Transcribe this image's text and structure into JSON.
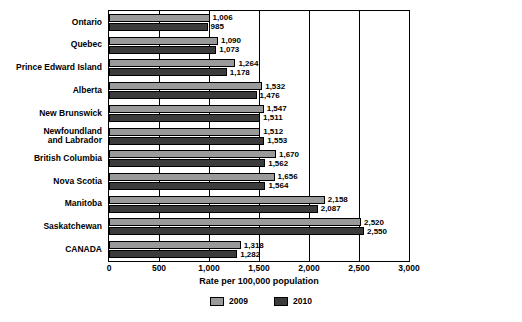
{
  "chart_data": {
    "type": "bar",
    "orientation": "horizontal",
    "title": "",
    "xlabel": "Rate per 100,000 population",
    "ylabel": "",
    "xlim": [
      0,
      3000
    ],
    "xticks": [
      "0",
      "500",
      "1,000",
      "1,500",
      "2,000",
      "2,500",
      "3,000"
    ],
    "grid": true,
    "legend_position": "bottom",
    "categories": [
      "Ontario",
      "Quebec",
      "Prince Edward Island",
      "Alberta",
      "New Brunswick",
      "Newfoundland\nand Labrador",
      "British Columbia",
      "Nova Scotia",
      "Manitoba",
      "Saskatchewan",
      "CANADA"
    ],
    "series": [
      {
        "name": "2009",
        "color": "#9a9a9a",
        "values": [
          1006,
          1090,
          1264,
          1532,
          1547,
          1512,
          1670,
          1656,
          2158,
          2520,
          1318
        ],
        "labels": [
          "1,006",
          "1,090",
          "1,264",
          "1,532",
          "1,547",
          "1,512",
          "1,670",
          "1,656",
          "2,158",
          "2,520",
          "1,318"
        ]
      },
      {
        "name": "2010",
        "color": "#3b3b3b",
        "values": [
          985,
          1073,
          1178,
          1476,
          1511,
          1553,
          1562,
          1564,
          2087,
          2550,
          1282
        ],
        "labels": [
          "985",
          "1,073",
          "1,178",
          "1,476",
          "1,511",
          "1,553",
          "1,562",
          "1,564",
          "2,087",
          "2,550",
          "1,282"
        ]
      }
    ]
  }
}
